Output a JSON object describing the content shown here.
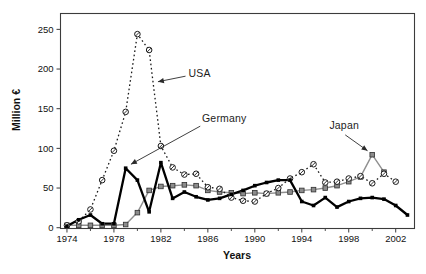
{
  "figure": {
    "background": "#ffffff",
    "frame_color": "#3c3c3c",
    "tick_label_color": "#111111"
  },
  "chart_data": {
    "type": "line",
    "title": "",
    "xlabel": "Years",
    "ylabel": "Million €",
    "grid": false,
    "legend": "inline-annotations",
    "x_ticks": [
      1974,
      1978,
      1982,
      1986,
      1990,
      1994,
      1998,
      2002
    ],
    "x_minor_ticks": [
      1976,
      1980,
      1984,
      1988,
      1992,
      1996,
      2000
    ],
    "y_ticks": [
      0,
      50,
      100,
      150,
      200,
      250
    ],
    "x_range": [
      1973.45,
      2003.6
    ],
    "y_range": [
      -1,
      270
    ],
    "series": [
      {
        "name": "Japan",
        "color": "#8f8f8f",
        "line_style": "solid-thin",
        "marker": "gray-square",
        "x": [
          1974,
          1975,
          1976,
          1977,
          1978,
          1979,
          1980,
          1981,
          1982,
          1983,
          1984,
          1985,
          1986,
          1987,
          1988,
          1989,
          1990,
          1991,
          1992,
          1993,
          1994,
          1995,
          1996,
          1997,
          1998,
          1999,
          2000,
          2001
        ],
        "values": [
          3,
          3,
          3,
          3,
          3,
          4,
          19,
          47,
          52,
          53,
          54,
          53,
          47,
          45,
          44,
          43,
          44,
          43,
          44,
          45,
          47,
          48,
          50,
          53,
          58,
          64,
          92,
          70
        ]
      },
      {
        "name": "USA",
        "color": "#1a1a1a",
        "line_style": "dotted",
        "marker": "slashed-circle",
        "x": [
          1974,
          1975,
          1976,
          1977,
          1978,
          1979,
          1980,
          1981,
          1982,
          1983,
          1984,
          1985,
          1986,
          1987,
          1988,
          1989,
          1990,
          1991,
          1992,
          1993,
          1994,
          1995,
          1996,
          1997,
          1998,
          1999,
          2000,
          2001,
          2002
        ],
        "values": [
          3,
          8,
          23,
          60,
          97,
          146,
          244,
          224,
          103,
          76,
          67,
          68,
          51,
          49,
          38,
          34,
          33,
          43,
          50,
          62,
          70,
          80,
          57,
          58,
          62,
          65,
          56,
          68,
          58
        ]
      },
      {
        "name": "Germany",
        "color": "#000000",
        "line_style": "solid-thick",
        "marker": "black-square",
        "x": [
          1974,
          1975,
          1976,
          1977,
          1978,
          1979,
          1980,
          1981,
          1982,
          1983,
          1984,
          1985,
          1986,
          1987,
          1988,
          1989,
          1990,
          1991,
          1992,
          1993,
          1994,
          1995,
          1996,
          1997,
          1998,
          1999,
          2000,
          2001,
          2002,
          2003
        ],
        "values": [
          2,
          10,
          16,
          5,
          5,
          75,
          60,
          20,
          82,
          37,
          45,
          39,
          35,
          37,
          42,
          47,
          53,
          57,
          60,
          60,
          33,
          28,
          38,
          26,
          33,
          37,
          38,
          36,
          28,
          16
        ]
      }
    ],
    "annotations": [
      {
        "label": "USA",
        "text_year": 1984.35,
        "text_value": 194,
        "arrow": {
          "from_year": 1984.1,
          "from_value": 191,
          "to_year": 1981.75,
          "to_value": 184
        }
      },
      {
        "label": "Germany",
        "text_year": 1985.5,
        "text_value": 137,
        "arrow": {
          "from_year": 1985.35,
          "from_value": 128,
          "to_year": 1979.45,
          "to_value": 80
        }
      },
      {
        "label": "Japan",
        "text_year": 1996.35,
        "text_value": 128,
        "arrow": {
          "from_year": 1997.7,
          "from_value": 117,
          "to_year": 1999.6,
          "to_value": 97
        }
      }
    ]
  }
}
